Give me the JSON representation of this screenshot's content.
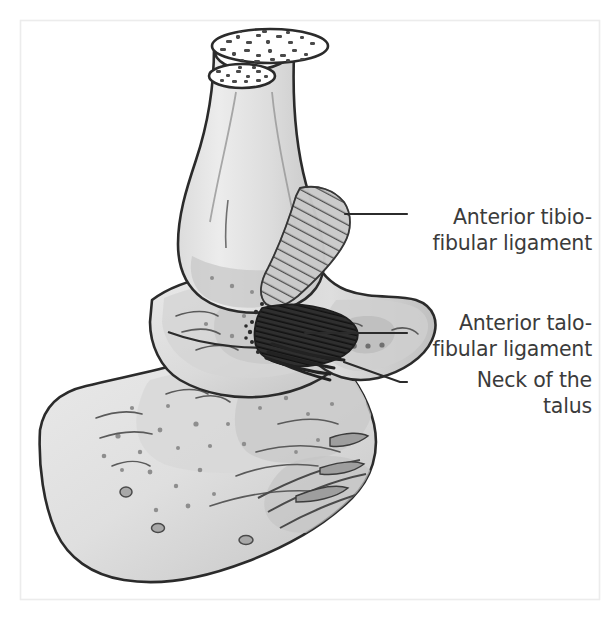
{
  "figure": {
    "type": "anatomical-illustration",
    "background_color": "#ffffff",
    "frame": {
      "name": "figure-border",
      "color": "#ececec",
      "x": 20,
      "y": 20,
      "width": 580,
      "height": 580
    },
    "palette": {
      "outline": "#2b2b2b",
      "bone_light": "#e6e6e6",
      "bone_mid": "#d2d2d2",
      "bone_shadow": "#bfbfbf",
      "bone_deep": "#ababab",
      "ligament_hatch": "#4a4a4a",
      "ligament_dark": "#333333",
      "label_text": "#3b3b3b",
      "leader_line": "#2b2b2b",
      "cut_surface": "#ffffff"
    }
  },
  "labels": [
    {
      "name": "label-anterior-tibiofibular-ligament",
      "lines": [
        "Anterior tibio-",
        "fibular ligament"
      ],
      "text_x": 592,
      "line1_y": 224,
      "line2_y": 250,
      "leader": {
        "x1": 345,
        "y1": 214,
        "x2": 407,
        "y2": 214
      }
    },
    {
      "name": "label-anterior-talofibular-ligament",
      "lines": [
        "Anterior talo-",
        "fibular ligament"
      ],
      "text_x": 592,
      "line1_y": 330,
      "line2_y": 356,
      "leader": {
        "x1": 305,
        "y1": 333,
        "x2": 407,
        "y2": 333
      }
    },
    {
      "name": "label-neck-of-the-talus",
      "lines": [
        "Neck of the",
        "talus"
      ],
      "text_x": 592,
      "line1_y": 387,
      "line2_y": 413,
      "leader_path": "M 344 362 L 400 382 L 407 382"
    }
  ],
  "structures": [
    {
      "name": "tibia",
      "label": "Tibia",
      "visible_label": false
    },
    {
      "name": "fibula",
      "label": "Fibula",
      "visible_label": false
    },
    {
      "name": "lateral-malleolus",
      "label": "Lateral malleolus",
      "visible_label": false
    },
    {
      "name": "talus",
      "label": "Talus",
      "visible_label": false
    },
    {
      "name": "neck-of-talus",
      "label": "Neck of the talus",
      "visible_label": true
    },
    {
      "name": "calcaneus",
      "label": "Calcaneus",
      "visible_label": false
    },
    {
      "name": "anterior-tibiofibular-ligament",
      "label": "Anterior tibiofibular ligament",
      "visible_label": true
    },
    {
      "name": "anterior-talofibular-ligament",
      "label": "Anterior talofibular ligament",
      "visible_label": true
    }
  ]
}
